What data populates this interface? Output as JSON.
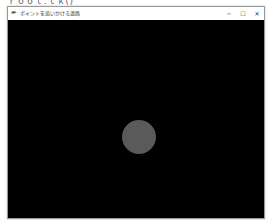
{
  "clipped_text": "ｒｏｏｔ.ｔｋ()",
  "window": {
    "title": "ポイントを追いかける迷路",
    "icon": "feather-icon",
    "controls": {
      "minimize": "─",
      "maximize": "☐",
      "close": "✕"
    }
  },
  "canvas": {
    "background": "#000000",
    "ball": {
      "color": "#5a5a5a",
      "center_x": 131,
      "center_y": 117,
      "diameter": 34
    }
  }
}
